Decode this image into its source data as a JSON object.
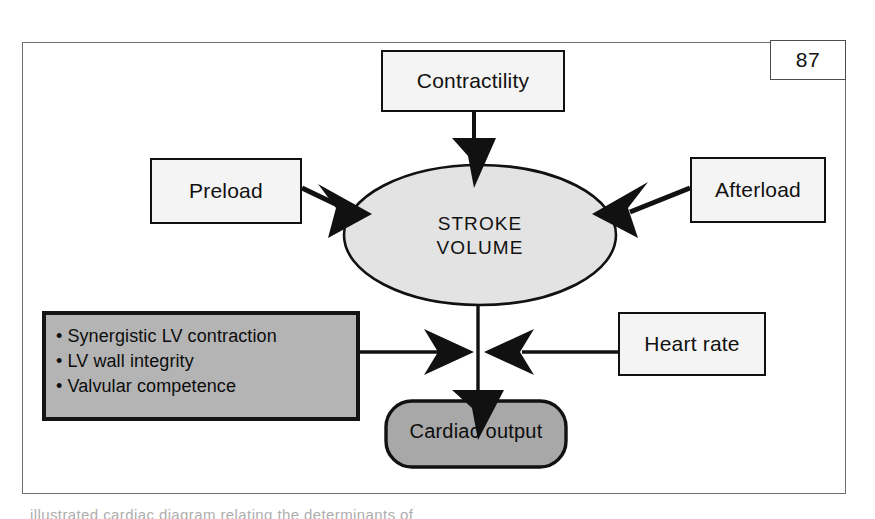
{
  "figure": {
    "page_number": "87",
    "caption_partial": "illustrated cardiac diagram relating the determinants of"
  },
  "nodes": {
    "contractility": {
      "label": "Contractility"
    },
    "preload": {
      "label": "Preload"
    },
    "afterload": {
      "label": "Afterload"
    },
    "stroke_volume": {
      "line1": "STROKE",
      "line2": "VOLUME"
    },
    "heart_rate": {
      "label": "Heart rate"
    },
    "cardiac_output": {
      "label": "Cardiac output"
    },
    "factors": {
      "bullets": [
        "Synergistic LV contraction",
        "LV wall integrity",
        "Valvular competence"
      ],
      "bullet_glyph": "•"
    }
  },
  "colors": {
    "frame_border": "#6d6d6d",
    "node_border": "#111111",
    "node_fill": "#f4f4f4",
    "ellipse_fill": "#e3e3e3",
    "factors_fill": "#b4b4b4",
    "cardiac_fill": "#a8a8a8",
    "arrow": "#111111",
    "text": "#111111"
  }
}
